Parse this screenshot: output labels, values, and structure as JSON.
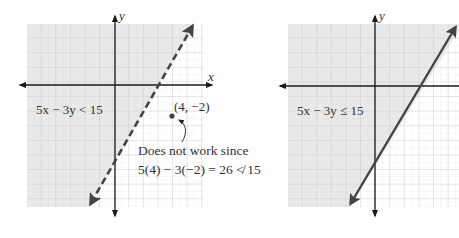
{
  "left_graph": {
    "axis_x_label": "x",
    "axis_y_label": "y",
    "inequality": "5x − 3y < 15",
    "boundary": "dashed",
    "test_point": "(4, −2)",
    "note_line1": "Does not work since",
    "note_line2": "5(4) − 3(−2) = 26 ≮ 15"
  },
  "right_graph": {
    "axis_y_label": "y",
    "inequality": "5x − 3y ≤ 15",
    "boundary": "solid"
  },
  "colors": {
    "shade": "#e9e9e9",
    "grid": "#c8c8c8",
    "axis": "#1a1a1a",
    "line": "#444444",
    "text": "#333333"
  }
}
